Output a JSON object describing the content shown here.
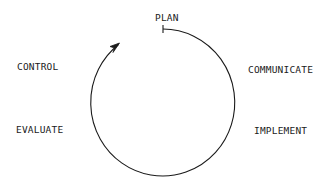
{
  "diagram": {
    "type": "cycle",
    "direction": "clockwise",
    "stages": [
      {
        "label": "PLAN"
      },
      {
        "label": "COMMUNICATE"
      },
      {
        "label": "IMPLEMENT"
      },
      {
        "label": "EVALUATE"
      },
      {
        "label": "CONTROL"
      }
    ]
  }
}
